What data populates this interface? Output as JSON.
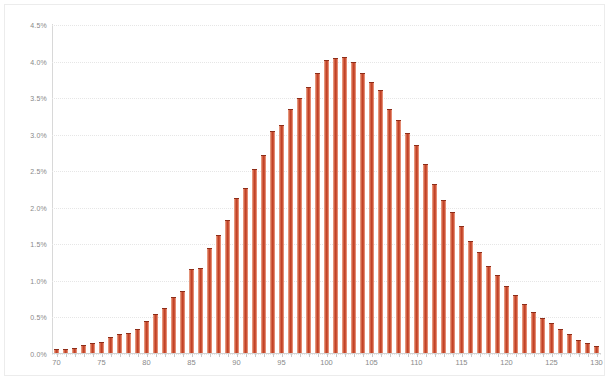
{
  "chart_data": {
    "type": "bar",
    "title": "",
    "subtitle": "",
    "xlabel": "",
    "ylabel": "",
    "grid": true,
    "legend": "none",
    "xlim": [
      69.5,
      130.5
    ],
    "ylim": [
      0,
      4.5
    ],
    "y_tick_labels": [
      "4.5%",
      "4.0%",
      "3.5%",
      "3.0%",
      "2.5%",
      "2.0%",
      "1.5%",
      "1.0%",
      "0.5%",
      "0.0%"
    ],
    "y_tick_values": [
      4.5,
      4.0,
      3.5,
      3.0,
      2.5,
      2.0,
      1.5,
      1.0,
      0.5,
      0.0
    ],
    "x_tick_labels": [
      "70",
      "75",
      "80",
      "85",
      "90",
      "95",
      "100",
      "105",
      "110",
      "115",
      "120",
      "125",
      "130"
    ],
    "x_tick_values": [
      70,
      75,
      80,
      85,
      90,
      95,
      100,
      105,
      110,
      115,
      120,
      125,
      130
    ],
    "value_suffix": "%",
    "bar_color": "#c8462a",
    "bar_highlight_color": "#f0b09c",
    "bar_edge_color": "#8e2d18",
    "categories": [
      70,
      71,
      72,
      73,
      74,
      75,
      76,
      77,
      78,
      79,
      80,
      81,
      82,
      83,
      84,
      85,
      86,
      87,
      88,
      89,
      90,
      91,
      92,
      93,
      94,
      95,
      96,
      97,
      98,
      99,
      100,
      101,
      102,
      103,
      104,
      105,
      106,
      107,
      108,
      109,
      110,
      111,
      112,
      113,
      114,
      115,
      116,
      117,
      118,
      119,
      120,
      121,
      122,
      123,
      124,
      125,
      126,
      127,
      128,
      129,
      130
    ],
    "values": [
      0.04,
      0.04,
      0.05,
      0.09,
      0.12,
      0.14,
      0.2,
      0.25,
      0.26,
      0.32,
      0.43,
      0.52,
      0.6,
      0.75,
      0.83,
      1.13,
      1.15,
      1.42,
      1.6,
      1.8,
      2.1,
      2.24,
      2.5,
      2.7,
      3.02,
      3.1,
      3.32,
      3.47,
      3.62,
      3.82,
      4.0,
      4.02,
      4.03,
      3.97,
      3.82,
      3.7,
      3.58,
      3.33,
      3.18,
      3.0,
      2.83,
      2.57,
      2.3,
      2.08,
      1.92,
      1.72,
      1.52,
      1.37,
      1.18,
      1.05,
      0.9,
      0.78,
      0.66,
      0.55,
      0.47,
      0.4,
      0.32,
      0.24,
      0.17,
      0.12,
      0.08
    ]
  }
}
